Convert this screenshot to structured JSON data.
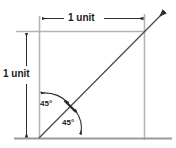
{
  "figure": {
    "type": "geometry-diagram",
    "background_color": "#ffffff"
  },
  "labels": {
    "width": "1 unit",
    "height": "1 unit",
    "angle_upper": "45°",
    "angle_lower": "45°"
  },
  "colors": {
    "square_stroke": "#b4b4b4",
    "baseline_stroke": "#9a9a9a",
    "diagonal_stroke": "#4a4a4a",
    "dimension_stroke": "#2b2b2b",
    "arc_stroke": "#2b2b2b",
    "text": "#1a1a1a"
  },
  "geometry": {
    "square": {
      "left": 39,
      "top": 31,
      "right": 144,
      "bottom": 138
    },
    "diagonal": {
      "x1": 39,
      "y1": 138,
      "x2": 168,
      "y2": 8
    },
    "width_dimension": {
      "y": 18,
      "x_start": 42,
      "x_end": 143
    },
    "height_dimension": {
      "x": 26,
      "y_start": 33,
      "y_end": 137
    },
    "baseline": {
      "y": 138,
      "x_start": 14,
      "x_end": 172
    },
    "tick_on_diagonal": {
      "cx": 70,
      "cy": 106
    },
    "angles": [
      {
        "name": "upper",
        "value": 45,
        "unit": "degrees"
      },
      {
        "name": "lower",
        "value": 45,
        "unit": "degrees"
      }
    ]
  }
}
